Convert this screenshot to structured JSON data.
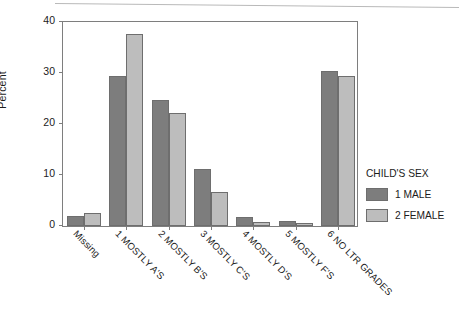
{
  "chart_data": {
    "type": "bar",
    "title": "",
    "subtitle": "",
    "xlabel": "",
    "ylabel": "Percent",
    "ylim": [
      0,
      40
    ],
    "yticks": [
      0,
      10,
      20,
      30,
      40
    ],
    "ytick_labels": [
      "0",
      "10",
      "20",
      "30",
      "40"
    ],
    "grid": false,
    "legend_position": "right",
    "legend_title": "CHILD'S SEX",
    "categories": [
      "Missing",
      "1  MOSTLY A'S",
      "2  MOSTLY B'S",
      "3  MOSTLY C'S",
      "4  MOSTLY D'S",
      "5  MOSTLY F'S",
      "6  NO LTR GRADES"
    ],
    "series": [
      {
        "name": "1 MALE",
        "color": "#7d7d7d",
        "values": [
          2.0,
          29.2,
          24.5,
          11.1,
          1.8,
          0.9,
          30.1
        ]
      },
      {
        "name": "2 FEMALE",
        "color": "#bdbdbd",
        "values": [
          2.5,
          37.3,
          22.0,
          6.6,
          0.8,
          0.5,
          29.2
        ]
      }
    ]
  },
  "axes": {
    "y_title": "Percent",
    "y_tick_labels": [
      "0",
      "10",
      "20",
      "30",
      "40"
    ]
  },
  "legend": {
    "title": "CHILD'S SEX",
    "entries": [
      {
        "label": "1 MALE",
        "swatch": "male"
      },
      {
        "label": "2 FEMALE",
        "swatch": "female"
      }
    ]
  },
  "colors": {
    "male_bar": "#7d7d7d",
    "female_bar": "#bdbdbd",
    "axis": "#7e7e7e",
    "text": "#1c1c1c",
    "background": "#ffffff"
  }
}
